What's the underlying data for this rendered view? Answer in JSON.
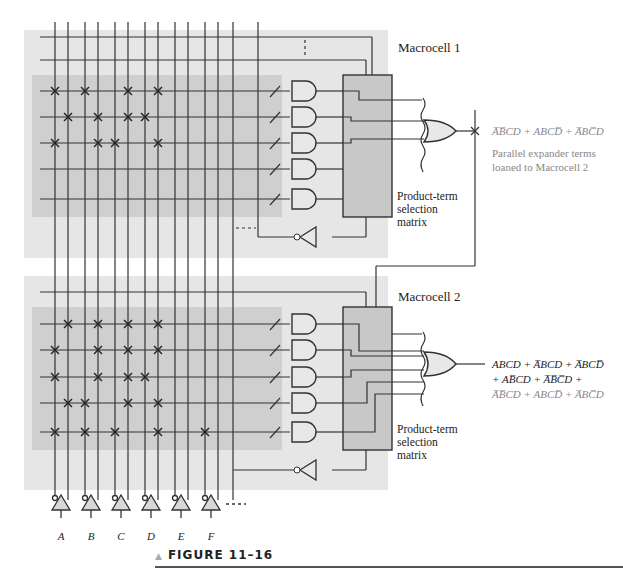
{
  "figure": {
    "caption": "FIGURE 11–16"
  },
  "macrocell1": {
    "title": "Macrocell 1",
    "matrix_label_lines": [
      "Product-term",
      "selection",
      "matrix"
    ],
    "output_expression": "A̅B̅CD + ABCD̅ + A̅BC̅D",
    "output_note_lines": [
      "Parallel expander terms",
      "loaned to Macrocell 2"
    ],
    "crosspoints_rows": [
      [
        0,
        2,
        5,
        7
      ],
      [
        1,
        3,
        5,
        6
      ],
      [
        0,
        3,
        4,
        7
      ],
      [],
      []
    ]
  },
  "macrocell2": {
    "title": "Macrocell 2",
    "matrix_label_lines": [
      "Product-term",
      "selection",
      "matrix"
    ],
    "output_expression_lines": [
      "ABCD + A̅BCD + A̅BCD̅",
      "+ AB̅CD + A̅B̅C̅D + ",
      "A̅B̅CD + ABCD̅ + A̅BC̅D"
    ],
    "crosspoints_rows": [
      [
        1,
        3,
        5,
        7
      ],
      [
        0,
        3,
        5,
        7
      ],
      [
        0,
        3,
        5,
        6
      ],
      [
        1,
        2,
        5,
        7
      ],
      [
        0,
        2,
        4,
        7,
        10
      ]
    ]
  },
  "inputs": {
    "labels": [
      "A",
      "B",
      "C",
      "D",
      "E",
      "F"
    ]
  },
  "colors": {
    "outer_panel": "#e6e6e6",
    "inner_panel": "#cfcfcf",
    "matrix_box": "#c8c8c8",
    "gate_fill": "#e8e8e8",
    "line": "#333333",
    "note_text": "#888888"
  }
}
